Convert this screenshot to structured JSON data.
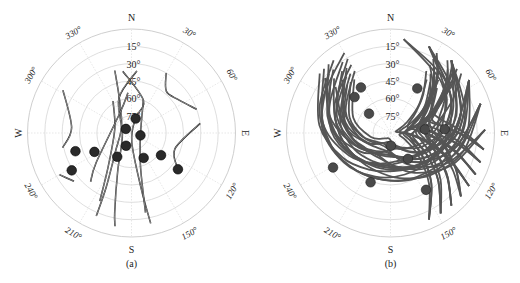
{
  "chart_data": [
    {
      "type": "scatter",
      "subtype": "polar-skyplot",
      "caption": "(a)",
      "track_color": "#111111",
      "cardinal_labels": {
        "N": "N",
        "E": "E",
        "S": "S",
        "W": "W"
      },
      "azimuth_labels": [
        "30°",
        "60°",
        "120°",
        "150°",
        "210°",
        "240°",
        "300°",
        "330°"
      ],
      "azimuth_ticks": [
        30,
        60,
        120,
        150,
        210,
        240,
        300,
        330
      ],
      "elevation_labels": [
        "15°",
        "30°",
        "45°",
        "60°",
        "75°"
      ],
      "elevation_rings": [
        15,
        30,
        45,
        60,
        75
      ],
      "elevation_range": [
        0,
        90
      ],
      "satellites": [
        {
          "az": 16,
          "el": 77
        },
        {
          "az": 306,
          "el": 84
        },
        {
          "az": 105,
          "el": 82
        },
        {
          "az": 203,
          "el": 78
        },
        {
          "az": 211,
          "el": 66
        },
        {
          "az": 243,
          "el": 54
        },
        {
          "az": 238,
          "el": 29
        },
        {
          "az": 252,
          "el": 39
        },
        {
          "az": 154,
          "el": 66
        },
        {
          "az": 127,
          "el": 58
        },
        {
          "az": 128,
          "el": 39
        }
      ],
      "tracks": [
        [
          [
            302,
            20
          ],
          [
            275,
            38
          ],
          [
            258,
            29
          ]
        ],
        [
          [
            345,
            34
          ],
          [
            340,
            60
          ],
          [
            300,
            80
          ],
          [
            220,
            68
          ],
          [
            205,
            38
          ],
          [
            203,
            12
          ]
        ],
        [
          [
            352,
            36
          ],
          [
            20,
            60
          ],
          [
            15,
            77
          ],
          [
            178,
            82
          ],
          [
            170,
            40
          ],
          [
            168,
            10
          ]
        ],
        [
          [
            5,
            36
          ],
          [
            340,
            58
          ],
          [
            260,
            82
          ],
          [
            200,
            55
          ],
          [
            192,
            20
          ],
          [
            190,
            8
          ]
        ],
        [
          [
            30,
            30
          ],
          [
            40,
            43
          ],
          [
            55,
            40
          ],
          [
            70,
            30
          ]
        ],
        [
          [
            82,
            30
          ],
          [
            110,
            50
          ],
          [
            128,
            39
          ]
        ],
        [
          [
            330,
            58
          ],
          [
            285,
            75
          ],
          [
            215,
            55
          ],
          [
            205,
            25
          ]
        ],
        [
          [
            20,
            60
          ],
          [
            105,
            82
          ],
          [
            165,
            60
          ],
          [
            170,
            20
          ]
        ],
        [
          [
            240,
            18
          ],
          [
            230,
            25
          ]
        ],
        [
          [
            355,
            55
          ],
          [
            330,
            70
          ],
          [
            230,
            50
          ],
          [
            220,
            35
          ]
        ]
      ]
    },
    {
      "type": "scatter",
      "subtype": "polar-skyplot",
      "caption": "(b)",
      "track_color": "#555555",
      "cardinal_labels": {
        "N": "N",
        "E": "E",
        "S": "S",
        "W": "W"
      },
      "azimuth_labels": [
        "30°",
        "60°",
        "120°",
        "150°",
        "210°",
        "240°",
        "300°",
        "330°"
      ],
      "azimuth_ticks": [
        30,
        60,
        120,
        150,
        210,
        240,
        300,
        330
      ],
      "elevation_labels": [
        "15°",
        "30°",
        "45°",
        "60°",
        "75°"
      ],
      "elevation_rings": [
        15,
        30,
        45,
        60,
        75
      ],
      "elevation_range": [
        0,
        90
      ],
      "satellites": [
        {
          "az": 327,
          "el": 43
        },
        {
          "az": 315,
          "el": 46
        },
        {
          "az": 312,
          "el": 65
        },
        {
          "az": 31,
          "el": 45
        },
        {
          "az": 84,
          "el": 60
        },
        {
          "az": 86,
          "el": 43
        },
        {
          "az": 178,
          "el": 79
        },
        {
          "az": 239,
          "el": 32
        },
        {
          "az": 146,
          "el": 63
        },
        {
          "az": 202,
          "el": 44
        },
        {
          "az": 148,
          "el": 32
        }
      ],
      "track_family": "dense gray arcs from north-west (≈330°) and north-east (≈30°) sweeping south",
      "track_count": 48
    }
  ]
}
